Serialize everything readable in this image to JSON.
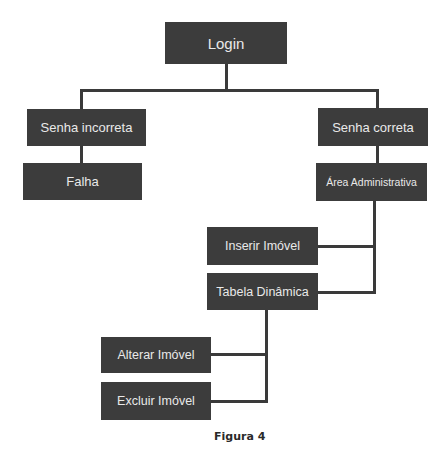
{
  "diagram": {
    "type": "tree",
    "nodes": [
      {
        "id": "login",
        "label": "Login"
      },
      {
        "id": "senha_incorreta",
        "label": "Senha incorreta",
        "parent": "login"
      },
      {
        "id": "falha",
        "label": "Falha",
        "parent": "senha_incorreta"
      },
      {
        "id": "senha_correta",
        "label": "Senha correta",
        "parent": "login"
      },
      {
        "id": "area_admin",
        "label": "Área Administrativa",
        "parent": "senha_correta"
      },
      {
        "id": "inserir",
        "label": "Inserir Imóvel",
        "parent": "area_admin"
      },
      {
        "id": "tabela",
        "label": "Tabela Dinâmica",
        "parent": "area_admin"
      },
      {
        "id": "alterar",
        "label": "Alterar Imóvel",
        "parent": "tabela"
      },
      {
        "id": "excluir",
        "label": "Excluir Imóvel",
        "parent": "tabela"
      }
    ],
    "caption": "Figura 4",
    "colors": {
      "node_fill": "#3c3c3c",
      "node_text": "#e9e9e9",
      "connector": "#3a3a3a"
    }
  }
}
